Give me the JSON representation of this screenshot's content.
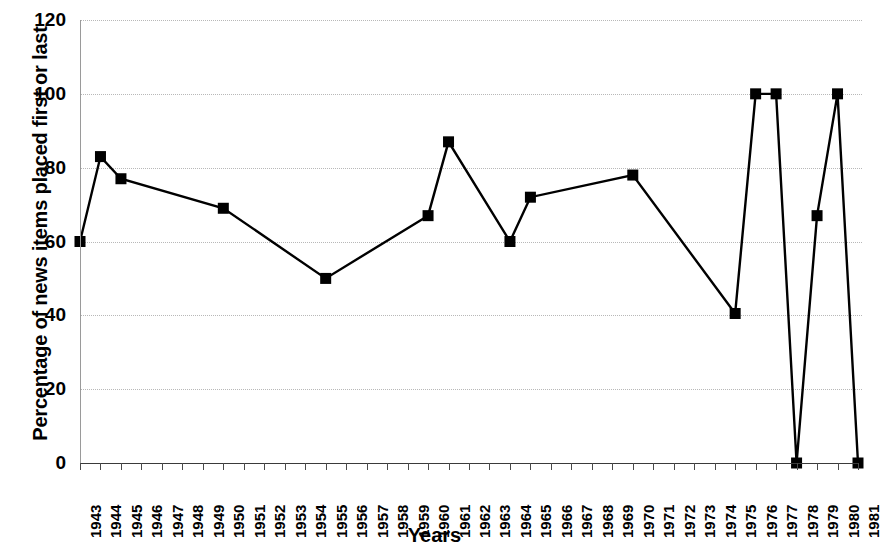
{
  "chart_data": {
    "type": "line",
    "title": "",
    "xlabel": "Years",
    "ylabel": "Percentage of news items placed first or last",
    "ylim": [
      0,
      120
    ],
    "yticks": [
      0,
      20,
      40,
      60,
      80,
      100,
      120
    ],
    "grid": true,
    "legend": "none",
    "marker": "square",
    "line_color": "#000000",
    "marker_color": "#000000",
    "grid_color": "#b8b8b8",
    "categories": [
      "1943",
      "1944",
      "1945",
      "1946",
      "1947",
      "1948",
      "1949",
      "1950",
      "1951",
      "1952",
      "1953",
      "1954",
      "1955",
      "1956",
      "1957",
      "1958",
      "1959",
      "1960",
      "1961",
      "1962",
      "1963",
      "1964",
      "1965",
      "1966",
      "1967",
      "1968",
      "1969",
      "1970",
      "1971",
      "1972",
      "1973",
      "1974",
      "1975",
      "1976",
      "1977",
      "1978",
      "1979",
      "1980",
      "1981"
    ],
    "points": [
      {
        "x": "1943",
        "y": 60
      },
      {
        "x": "1944",
        "y": 83
      },
      {
        "x": "1945",
        "y": 77
      },
      {
        "x": "1950",
        "y": 69
      },
      {
        "x": "1955",
        "y": 50
      },
      {
        "x": "1960",
        "y": 67
      },
      {
        "x": "1961",
        "y": 87
      },
      {
        "x": "1964",
        "y": 60
      },
      {
        "x": "1965",
        "y": 72
      },
      {
        "x": "1970",
        "y": 78
      },
      {
        "x": "1975",
        "y": 40.5
      },
      {
        "x": "1976",
        "y": 100
      },
      {
        "x": "1977",
        "y": 100
      },
      {
        "x": "1978",
        "y": 0
      },
      {
        "x": "1979",
        "y": 67
      },
      {
        "x": "1980",
        "y": 100
      },
      {
        "x": "1981",
        "y": 0
      }
    ]
  }
}
